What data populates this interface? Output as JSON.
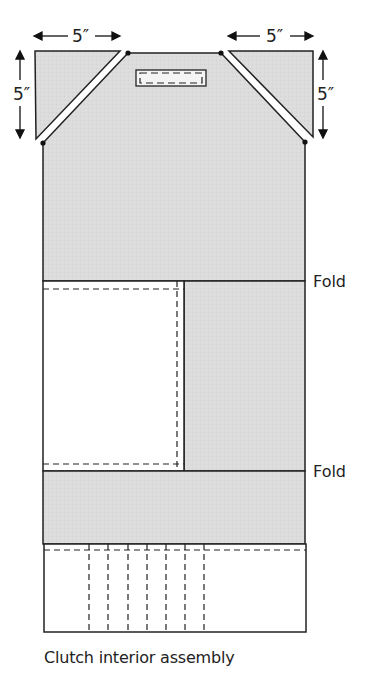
{
  "diagram": {
    "caption": "Clutch interior assembly",
    "dimensions": {
      "top_left_width": "5″",
      "top_left_height": "5″",
      "top_right_width": "5″",
      "top_right_height": "5″"
    },
    "fold_labels": [
      "Fold",
      "Fold"
    ],
    "colors": {
      "fabric_fill": "#dcdcdc",
      "outline": "#222222",
      "background": "#ffffff"
    },
    "parts": [
      {
        "name": "corner triangle left",
        "size": "5 x 5 in"
      },
      {
        "name": "corner triangle right",
        "size": "5 x 5 in"
      },
      {
        "name": "closure tab slot"
      },
      {
        "name": "main lining panel"
      },
      {
        "name": "pocket panel (white, stitched)"
      },
      {
        "name": "pen/card slot pocket with 7 vertical stitch lines"
      }
    ]
  }
}
